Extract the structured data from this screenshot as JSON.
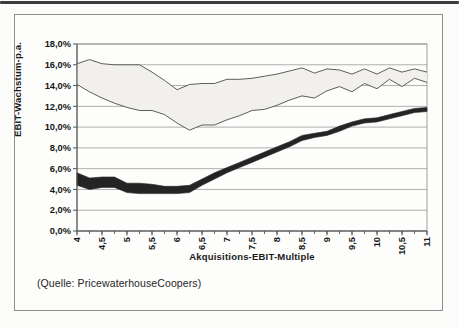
{
  "page": {
    "caption": "(Quelle: PricewaterhouseCoopers)"
  },
  "chart_data": {
    "type": "area",
    "subtype": "range-bands",
    "title": "",
    "xlabel": "Akquisitions-EBIT-Multiple",
    "ylabel": "EBIT-Wachstum-p.a.",
    "xlim": [
      4,
      11
    ],
    "ylim": [
      0,
      18
    ],
    "grid": "horizontal",
    "y_tick_step": 2,
    "y_tick_labels": [
      "0,0%",
      "2,0%",
      "4,0%",
      "6,0%",
      "8,0%",
      "10,0%",
      "12,0%",
      "14,0%",
      "16,0%",
      "18,0%"
    ],
    "x_tick_values": [
      4,
      4.5,
      5,
      5.5,
      6,
      6.5,
      7,
      7.5,
      8,
      8.5,
      9,
      9.5,
      10,
      10.5,
      11
    ],
    "x_tick_labels": [
      "4",
      "4,5",
      "5",
      "5,5",
      "6",
      "6,5",
      "7",
      "7,5",
      "8",
      "8,5",
      "9",
      "9,5",
      "10",
      "10,5",
      "11"
    ],
    "x_minor_tick_step": 0.25,
    "x": [
      4,
      4.25,
      4.5,
      4.75,
      5,
      5.25,
      5.5,
      5.75,
      6,
      6.25,
      6.5,
      6.75,
      7,
      7.25,
      7.5,
      7.75,
      8,
      8.25,
      8.5,
      8.75,
      9,
      9.25,
      9.5,
      9.75,
      10,
      10.25,
      10.5,
      10.75,
      11
    ],
    "series": [
      {
        "id": "upper-band",
        "style": "light",
        "upper": [
          16.1,
          16.5,
          16.1,
          16.0,
          16.0,
          16.0,
          15.3,
          14.5,
          13.6,
          14.1,
          14.2,
          14.2,
          14.6,
          14.6,
          14.7,
          14.9,
          15.1,
          15.4,
          15.7,
          15.2,
          15.6,
          15.5,
          15.1,
          15.6,
          15.1,
          15.7,
          15.3,
          15.6,
          15.3
        ],
        "lower": [
          14.1,
          13.4,
          12.8,
          12.3,
          11.9,
          11.6,
          11.6,
          11.2,
          10.4,
          9.7,
          10.2,
          10.2,
          10.7,
          11.1,
          11.6,
          11.7,
          12.1,
          12.6,
          13.0,
          12.8,
          13.5,
          13.9,
          13.4,
          14.2,
          13.7,
          14.6,
          13.9,
          14.7,
          14.3
        ]
      },
      {
        "id": "lower-band",
        "style": "dark",
        "upper": [
          5.6,
          5.1,
          5.2,
          5.2,
          4.6,
          4.6,
          4.5,
          4.3,
          4.3,
          4.4,
          5.0,
          5.6,
          6.1,
          6.6,
          7.1,
          7.6,
          8.1,
          8.6,
          9.2,
          9.4,
          9.6,
          10.1,
          10.5,
          10.8,
          10.9,
          11.2,
          11.5,
          11.8,
          11.9
        ],
        "lower": [
          4.4,
          4.0,
          4.2,
          4.2,
          3.7,
          3.6,
          3.6,
          3.6,
          3.6,
          3.7,
          4.4,
          5.0,
          5.6,
          6.1,
          6.6,
          7.1,
          7.6,
          8.1,
          8.7,
          9.0,
          9.2,
          9.6,
          10.1,
          10.4,
          10.5,
          10.8,
          11.1,
          11.4,
          11.5
        ]
      }
    ],
    "legend": "none"
  },
  "colors": {
    "paper": "#fcfcfa",
    "top_rule": "#3d3d3d",
    "frame_border": "#8f8f8f",
    "plot_border": "#8a8a8a",
    "grid": "#9a9a9a",
    "axis": "#555555",
    "tick_text": "#161616",
    "band_light_fill": "#f1f0ec",
    "band_light_edge": "#4c4c4c",
    "band_dark_fill": "#242424",
    "text": "#1c1c1c"
  }
}
